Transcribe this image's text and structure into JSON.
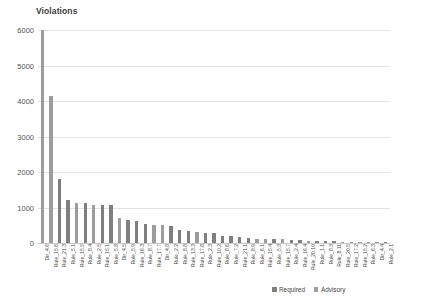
{
  "chart_data": {
    "type": "bar",
    "title": "Violations",
    "xlabel": "",
    "ylabel": "",
    "ylim": [
      0,
      6000
    ],
    "yticks": [
      0,
      1000,
      2000,
      3000,
      4000,
      5000,
      6000
    ],
    "ytick_labels": [
      "0",
      "1000",
      "2000",
      "3000",
      "4000",
      "5000",
      "6000"
    ],
    "grid": true,
    "legend_position": "bottom-right",
    "legend": [
      "Required",
      "Advisory"
    ],
    "colors": {
      "Required": "#7f7f7f",
      "Advisory": "#9d9d9d"
    },
    "categories": [
      "Dir_4.6",
      "Rule_15.6",
      "Rule_21.3",
      "Rule_5.1",
      "Rule_15.5",
      "Rule_8.4",
      "Rule_2.5",
      "Rule_15.1",
      "Rule_5.8",
      "Dir_4.5",
      "Rule_5.9",
      "Rule_16.3",
      "Rule_8.7",
      "Rule_17.7",
      "Dir_4.8",
      "Rule_2.2",
      "Rule_8.8",
      "Rule_13.3",
      "Rule_17.8",
      "Rule_2.3",
      "Rule_10.2",
      "Rule_8.6",
      "Rule_7.2",
      "Rule_21.1",
      "Rule_8.9",
      "Rule_6.1",
      "Rule_15.4",
      "Rule_5.3",
      "Rule_15.7",
      "Rule_2.4",
      "Rule_16.4",
      "Rule_20.10",
      "Rule_1.1",
      "Rule_8.3",
      "Rule_8.11",
      "Rule_20.5",
      "Rule_17.2",
      "Rule_15.2",
      "Rule_6.3",
      "Dir_4.4",
      "Rule_2.1"
    ],
    "series_by_category": [
      "Advisory",
      "Advisory",
      "Required",
      "Required",
      "Advisory",
      "Required",
      "Advisory",
      "Required",
      "Required",
      "Advisory",
      "Required",
      "Required",
      "Required",
      "Advisory",
      "Advisory",
      "Required",
      "Required",
      "Required",
      "Advisory",
      "Required",
      "Required",
      "Required",
      "Required",
      "Required",
      "Required",
      "Advisory",
      "Advisory",
      "Required",
      "Advisory",
      "Required",
      "Required",
      "Advisory",
      "Required",
      "Required",
      "Required",
      "Advisory",
      "Advisory",
      "Advisory",
      "Advisory",
      "Advisory",
      "Required"
    ],
    "values": [
      6000,
      4150,
      1800,
      1200,
      1130,
      1130,
      1080,
      1070,
      1060,
      700,
      640,
      610,
      530,
      520,
      500,
      480,
      380,
      330,
      300,
      290,
      280,
      190,
      185,
      180,
      140,
      120,
      115,
      110,
      100,
      95,
      90,
      60,
      55,
      50,
      45,
      40,
      35,
      30,
      28,
      25,
      20
    ]
  }
}
